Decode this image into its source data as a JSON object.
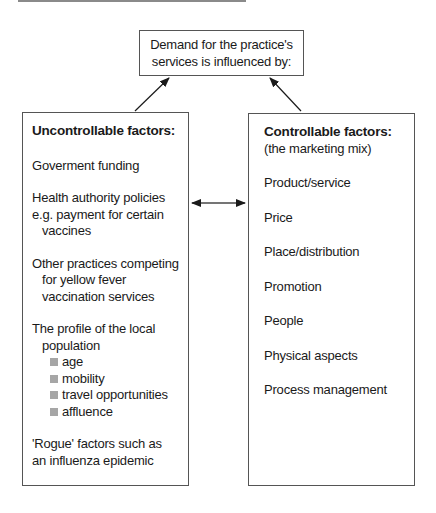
{
  "top_box": {
    "lines": [
      "Demand for the practice's",
      "services is influenced by:"
    ]
  },
  "left_box": {
    "title": "Uncontrollable factors:",
    "items": [
      {
        "lines": [
          "Goverment funding"
        ]
      },
      {
        "lines": [
          "Health authority policies",
          "e.g. payment for certain",
          "vaccines"
        ]
      },
      {
        "lines": [
          "Other practices competing",
          "for yellow fever",
          "vaccination services"
        ]
      },
      {
        "lines": [
          "The profile of the local",
          "population"
        ],
        "bullets": [
          "age",
          "mobility",
          "travel opportunities",
          "affluence"
        ]
      },
      {
        "lines": [
          "'Rogue' factors such as",
          "an influenza epidemic"
        ]
      }
    ]
  },
  "right_box": {
    "title": "Controllable factors:",
    "subtitle": "(the marketing mix)",
    "items": [
      "Product/service",
      "Price",
      "Place/distribution",
      "Promotion",
      "People",
      "Physical aspects",
      "Process management"
    ]
  },
  "colors": {
    "border": "#555555",
    "bullet": "#a6a6a6",
    "arrow": "#1a1a1a"
  }
}
